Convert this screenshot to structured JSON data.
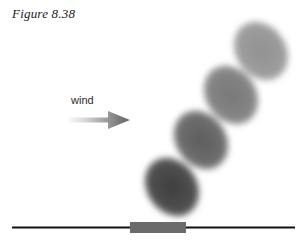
{
  "figure": {
    "caption": "Figure 8.38",
    "background_color": "#ffffff"
  },
  "wind": {
    "label": "wind",
    "arrow_direction": "right",
    "arrow_gradient_from": "#f2f2f2",
    "arrow_gradient_to": "#6e6e6e",
    "arrow_x": 66,
    "arrow_y": 108,
    "arrow_width": 66,
    "arrow_height": 24
  },
  "ground": {
    "line_color": "#111111",
    "line_y": 227,
    "line_x_start": 12,
    "line_x_end": 295,
    "line_thickness": 2,
    "block_label": "sediment-block",
    "block_color": "#6b6b6b",
    "block_x": 130,
    "block_y": 222,
    "block_width": 56,
    "block_height": 11
  },
  "chart_data": {
    "type": "scatter",
    "title": "Figure 8.38",
    "xlabel": "",
    "ylabel": "",
    "xlim": [
      0,
      307
    ],
    "ylim": [
      241,
      0
    ],
    "grid": false,
    "legend": "none",
    "annotations": [
      "wind"
    ],
    "series": [
      {
        "name": "saltating-grain-path",
        "points": [
          {
            "index": 1,
            "cx": 172,
            "cy": 187,
            "rx": 25,
            "ry": 31,
            "rotation": -35,
            "fill": "#4a4a4a",
            "opacity": 1.0
          },
          {
            "index": 2,
            "cx": 201,
            "cy": 140,
            "rx": 25,
            "ry": 31,
            "rotation": -35,
            "fill": "#606060",
            "opacity": 0.95
          },
          {
            "index": 3,
            "cx": 231,
            "cy": 95,
            "rx": 25,
            "ry": 31,
            "rotation": -35,
            "fill": "#757575",
            "opacity": 0.92
          },
          {
            "index": 4,
            "cx": 261,
            "cy": 51,
            "rx": 25,
            "ry": 31,
            "rotation": -35,
            "fill": "#8d8d8d",
            "opacity": 0.9
          }
        ]
      }
    ]
  }
}
